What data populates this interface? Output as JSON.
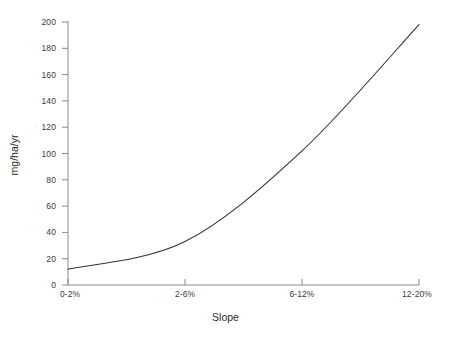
{
  "chart_data": {
    "type": "line",
    "title": "",
    "xlabel": "Slope",
    "ylabel": "mg/ha/yr",
    "categories": [
      "0-2%",
      "2-6%",
      "6-12%",
      "12-20%"
    ],
    "values": [
      12,
      33,
      102,
      198
    ],
    "series": [
      {
        "name": "soil loss",
        "values": [
          12,
          33,
          102,
          198
        ]
      }
    ],
    "ylim": [
      0,
      200
    ],
    "yticks": [
      0,
      20,
      40,
      60,
      80,
      100,
      120,
      140,
      160,
      180,
      200
    ],
    "ytick_labels": [
      "0",
      "20",
      "40",
      "60",
      "80",
      "100",
      "120",
      "140",
      "160",
      "180",
      "200"
    ],
    "xtick_labels": [
      "0-2%",
      "2-6%",
      "6-12%",
      "12-20%"
    ],
    "grid": false,
    "legend": "none",
    "line_color": "#333333",
    "axis_color": "#8a8a8a",
    "background_color": "#ffffff"
  }
}
